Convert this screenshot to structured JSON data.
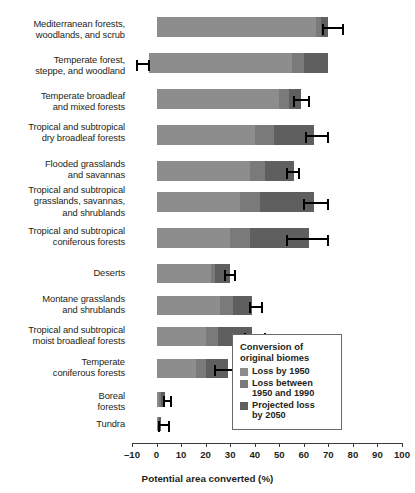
{
  "chart_data": {
    "type": "bar",
    "orientation": "horizontal",
    "stacked": true,
    "title": "",
    "xlabel": "Potential area converted (%)",
    "ylabel": "",
    "xlim": [
      -10,
      100
    ],
    "xticks": [
      "–10",
      "0",
      "10",
      "20",
      "30",
      "40",
      "50",
      "60",
      "70",
      "80",
      "90",
      "100"
    ],
    "xtick_values": [
      -10,
      0,
      10,
      20,
      30,
      40,
      50,
      60,
      70,
      80,
      90,
      100
    ],
    "grid": false,
    "legend_position": "inside-lower-right",
    "categories": [
      "Mediterranean forests,\nwoodlands, and scrub",
      "Temperate forest,\nsteppe, and woodland",
      "Temperate broadleaf\nand mixed forests",
      "Tropical and subtropical\ndry broadleaf forests",
      "Flooded grasslands\nand savannas",
      "Tropical and subtropical\ngrasslands, savannas,\nand shrublands",
      "Tropical and subtropical\nconiferous forests",
      "Deserts",
      "Montane grasslands\nand shrublands",
      "Tropical and subtropical\nmoist broadleaf forests",
      "Temperate\nconiferous forests",
      "Boreal\nforests",
      "Tundra"
    ],
    "series": [
      {
        "name": "Loss by 1950",
        "color": "#8d8d8d",
        "values": [
          65,
          58,
          50,
          40,
          38,
          34,
          30,
          22,
          26,
          20,
          16,
          1,
          0.5
        ]
      },
      {
        "name": "Loss between 1950 and 1990",
        "color": "#7a7a7a",
        "values": [
          2,
          5,
          4,
          8,
          6,
          8,
          8,
          2,
          5,
          5,
          4,
          1,
          0.5
        ]
      },
      {
        "name": "Projected loss by 2050",
        "color": "#5f5f5f",
        "values": [
          3,
          10,
          5,
          16,
          12,
          22,
          24,
          6,
          8,
          14,
          9,
          1.5,
          1
        ]
      }
    ],
    "bar_starts": [
      0,
      -3,
      0,
      0,
      0,
      0,
      0,
      0,
      0,
      0,
      0,
      0,
      0
    ],
    "totals": [
      70,
      70,
      59,
      64,
      56,
      64,
      62,
      30,
      39,
      39,
      29,
      3.5,
      2
    ],
    "error_bars": [
      {
        "category": "Mediterranean forests, woodlands, and scrub",
        "center": 68,
        "low": 68,
        "high": 76
      },
      {
        "category": "Temperate forest, steppe, and woodland",
        "center": -3,
        "low": -8,
        "high": -3
      },
      {
        "category": "Temperate broadleaf and mixed forests",
        "center": 56,
        "low": 56,
        "high": 62
      },
      {
        "category": "Tropical and subtropical dry broadleaf forests",
        "center": 61,
        "low": 61,
        "high": 70
      },
      {
        "category": "Flooded grasslands and savannas",
        "center": 53,
        "low": 53,
        "high": 58
      },
      {
        "category": "Tropical and subtropical grasslands, savannas, and shrublands",
        "center": 60,
        "low": 60,
        "high": 70
      },
      {
        "category": "Tropical and subtropical coniferous forests",
        "center": 53,
        "low": 53,
        "high": 70
      },
      {
        "category": "Deserts",
        "center": 28,
        "low": 28,
        "high": 32
      },
      {
        "category": "Montane grasslands and shrublands",
        "center": 38,
        "low": 38,
        "high": 43
      },
      {
        "category": "Tropical and subtropical moist broadleaf forests",
        "center": 36,
        "low": 36,
        "high": 44
      },
      {
        "category": "Temperate coniferous forests",
        "center": 24,
        "low": 24,
        "high": 32
      },
      {
        "category": "Boreal forests",
        "center": 3,
        "low": 3,
        "high": 6
      },
      {
        "category": "Tundra",
        "center": 1,
        "low": 1,
        "high": 5
      }
    ]
  },
  "legend": {
    "title": "Conversion of\noriginal biomes",
    "items": [
      {
        "label": "Loss by 1950",
        "color": "#8d8d8d"
      },
      {
        "label": "Loss between\n1950 and 1990",
        "color": "#7a7a7a"
      },
      {
        "label": "Projected loss\nby 2050",
        "color": "#5f5f5f"
      }
    ]
  },
  "axis": {
    "title": "Potential area converted (%)"
  }
}
